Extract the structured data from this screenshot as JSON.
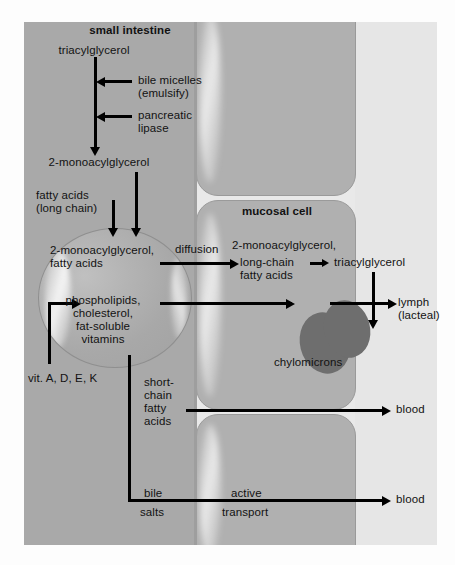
{
  "diagram": {
    "colors": {
      "lumen": "#a9a9a9",
      "cell": "#b0b0b0",
      "outside": "#e6e6e6",
      "chylomicron": "#6e6e6e",
      "arrow": "#000000",
      "text": "#121212"
    }
  },
  "labels": {
    "small_intestine": "small intestine",
    "triacylglycerol": "triacylglycerol",
    "bile_micelles_1": "bile micelles",
    "bile_micelles_2": "(emulsify)",
    "pancreatic_1": "pancreatic",
    "pancreatic_2": "lipase",
    "monoacylglycerol_lumen": "2-monoacylglycerol",
    "fatty_acids_1": "fatty acids",
    "fatty_acids_2": "(long chain)",
    "micelle_contents_1": "2-monoacylglycerol,",
    "micelle_contents_2": "fatty acids",
    "micelle_contents_3": "phospholipids,",
    "micelle_contents_4": "cholesterol,",
    "micelle_contents_5": "fat-soluble",
    "micelle_contents_6": "vitamins",
    "vitamins": "vit. A, D, E, K",
    "diffusion": "diffusion",
    "mucosal_cell": "mucosal cell",
    "cell_contents_1": "2-monoacylglycerol,",
    "cell_contents_2": "long-chain",
    "cell_contents_3": "fatty acids",
    "triacylglycerol_cell": "triacylglycerol",
    "chylomicrons": "chylomicrons",
    "lymph_1": "lymph",
    "lymph_2": "(lacteal)",
    "short_chain_1": "short-",
    "short_chain_2": "chain",
    "short_chain_3": "fatty",
    "short_chain_4": "acids",
    "blood_top": "blood",
    "bile_1": "bile",
    "bile_2": "salts",
    "active_1": "active",
    "active_2": "transport",
    "blood_bottom": "blood"
  }
}
